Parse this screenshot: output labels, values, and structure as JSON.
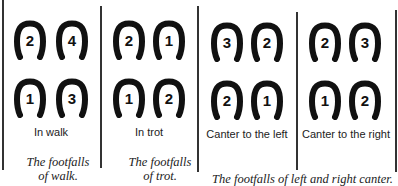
{
  "panels": [
    {
      "label": "In walk",
      "shoes": {
        "top_left": "2",
        "top_right": "4",
        "bottom_left": "1",
        "bottom_right": "3"
      }
    },
    {
      "label": "In trot",
      "shoes": {
        "top_left": "2",
        "top_right": "1",
        "bottom_left": "1",
        "bottom_right": "2"
      }
    },
    {
      "label": "Canter to the left",
      "shoes": {
        "top_left": "3",
        "top_right": "2",
        "bottom_left": "2",
        "bottom_right": "1"
      }
    },
    {
      "label": "Canter to the right",
      "shoes": {
        "top_left": "2",
        "top_right": "3",
        "bottom_left": "1",
        "bottom_right": "2"
      }
    }
  ],
  "captions": {
    "walk": {
      "line1": "The footfalls",
      "line2": "of walk."
    },
    "trot": {
      "line1": "The footfalls",
      "line2": "of trot."
    },
    "canter": "The footfalls of left and right canter."
  }
}
